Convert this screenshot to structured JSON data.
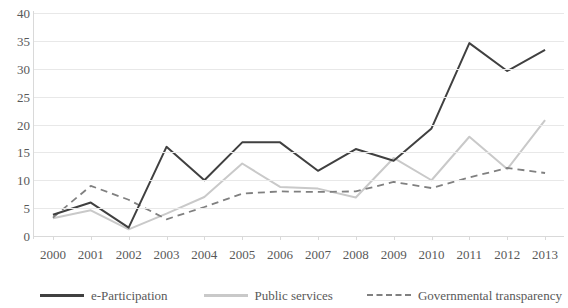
{
  "chart_data": {
    "type": "line",
    "title": "",
    "xlabel": "",
    "ylabel": "",
    "categories": [
      "2000",
      "2001",
      "2002",
      "2003",
      "2004",
      "2005",
      "2006",
      "2007",
      "2008",
      "2009",
      "2010",
      "2011",
      "2012",
      "2013"
    ],
    "ylim": [
      0,
      40
    ],
    "yticks": [
      0,
      5,
      10,
      15,
      20,
      25,
      30,
      35,
      40
    ],
    "grid": true,
    "legend_position": "bottom",
    "series": [
      {
        "name": "e-Participation",
        "color": "#404040",
        "style": "solid",
        "values": [
          3.8,
          6.0,
          1.5,
          16.0,
          10.0,
          16.8,
          16.8,
          11.7,
          15.6,
          13.5,
          19.3,
          34.6,
          29.6,
          33.4
        ]
      },
      {
        "name": "Public services",
        "color": "#c9c9c9",
        "style": "solid",
        "values": [
          3.2,
          4.6,
          1.2,
          4.0,
          7.0,
          13.0,
          8.8,
          8.5,
          6.9,
          14.0,
          10.0,
          17.8,
          12.0,
          20.8
        ]
      },
      {
        "name": "Governmental transparency",
        "color": "#808080",
        "style": "dashed",
        "values": [
          3.3,
          9.0,
          6.5,
          3.0,
          5.2,
          7.6,
          8.0,
          7.9,
          8.0,
          9.7,
          8.6,
          10.5,
          12.2,
          11.3
        ]
      }
    ]
  }
}
